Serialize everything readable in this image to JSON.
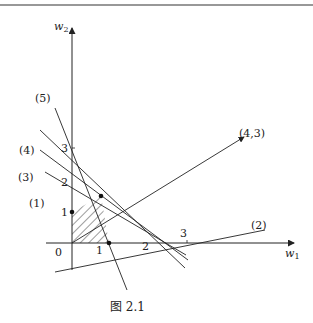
{
  "figure": {
    "caption": "图 2.1",
    "axes": {
      "x_label": "w",
      "x_label_sub": "1",
      "y_label": "w",
      "y_label_sub": "2",
      "origin_label": "0"
    },
    "x_ticks": [
      "1",
      "2",
      "3"
    ],
    "y_ticks": [
      "1",
      "2",
      "3"
    ],
    "line_labels": {
      "l1": "(1)",
      "l2": "(2)",
      "l3": "(3)",
      "l4": "(4)",
      "l5": "(5)"
    },
    "vector_label": "(4,3)",
    "colors": {
      "ink": "#222222",
      "background": "#ffffff"
    }
  }
}
